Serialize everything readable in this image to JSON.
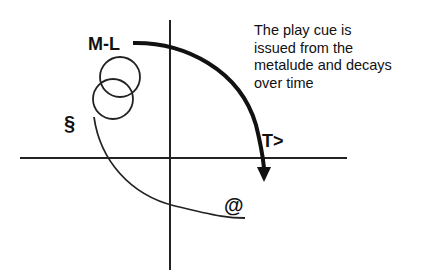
{
  "diagram": {
    "labels": {
      "metalude": "M-L",
      "section": "§",
      "time": "T>",
      "at": "@"
    },
    "caption_lines": [
      "The play cue is",
      "issued from the",
      "metalude and decays",
      "over time"
    ],
    "colors": {
      "stroke": "#111111",
      "background": "#ffffff"
    }
  }
}
